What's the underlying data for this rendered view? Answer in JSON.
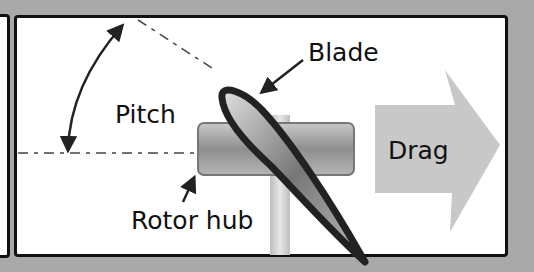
{
  "labels": {
    "blade": "Blade",
    "pitch": "Pitch",
    "drag": "Drag",
    "rotor_hub": "Rotor hub"
  },
  "colors": {
    "background": "#a9a9a9",
    "panel": "#ffffff",
    "outline": "#111111",
    "arrow_fill": "#c8c8c8",
    "hub_fill": "#9a9a9a"
  }
}
